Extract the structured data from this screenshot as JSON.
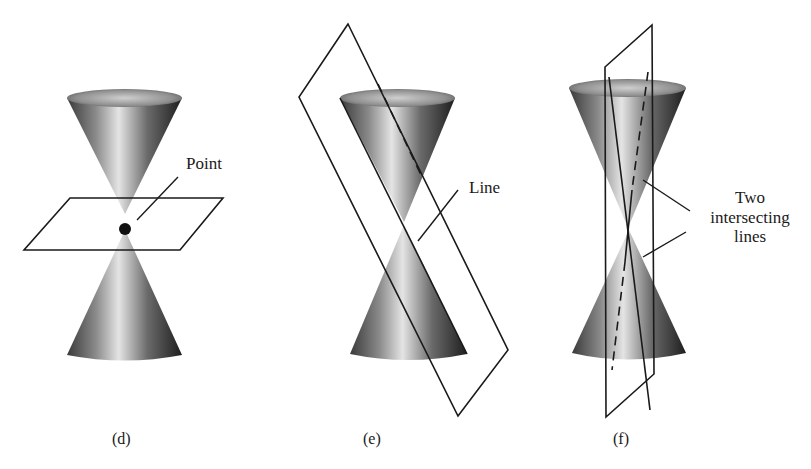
{
  "figure": {
    "panels": [
      {
        "id": "d",
        "caption": "(d)",
        "annotation": [
          "Point"
        ],
        "description": "Double cone cut by a horizontal plane through the vertex, giving a single point"
      },
      {
        "id": "e",
        "caption": "(e)",
        "annotation": [
          "Line"
        ],
        "description": "Double cone cut by a tilted plane tangent along a generator, giving a line"
      },
      {
        "id": "f",
        "caption": "(f)",
        "annotation": [
          "Two",
          "intersecting",
          "lines"
        ],
        "description": "Double cone cut by a vertical plane through the vertex, giving two intersecting lines"
      }
    ],
    "colors": {
      "background": "#ffffff",
      "stroke": "#1a1a1a",
      "cone_dark": "#2a2a2a",
      "cone_light": "#e8e8e8"
    }
  }
}
